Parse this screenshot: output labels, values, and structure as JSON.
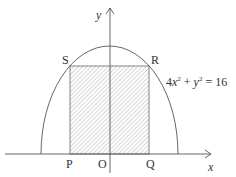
{
  "diagram": {
    "type": "geometry",
    "curve": {
      "equation_text": "4x² + y² = 16",
      "equation_parts": {
        "c1": "4",
        "v1": "x",
        "e1": "2",
        "op": " + ",
        "v2": "y",
        "e2": "2",
        "rhs": " = 16"
      }
    },
    "axes": {
      "x_label": "x",
      "y_label": "y"
    },
    "points": {
      "S": "S",
      "R": "R",
      "P": "P",
      "O": "O",
      "Q": "Q"
    },
    "colors": {
      "stroke": "#555555",
      "hatch": "#888888",
      "text": "#333333"
    }
  }
}
